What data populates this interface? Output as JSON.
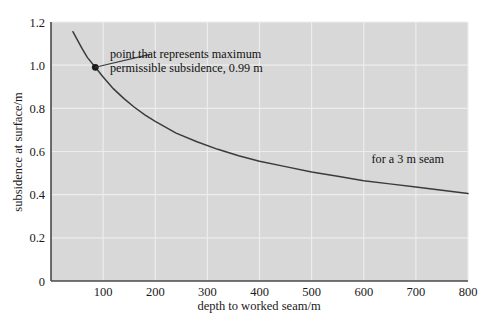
{
  "chart_data": {
    "type": "line",
    "title": "",
    "xlabel": "depth to worked seam/m",
    "ylabel": "subsidence at surface/m",
    "xlim": [
      0,
      800
    ],
    "ylim": [
      0,
      1.2
    ],
    "xticks": [
      "100",
      "200",
      "300",
      "400",
      "500",
      "600",
      "700",
      "800"
    ],
    "xtick_values": [
      100,
      200,
      300,
      400,
      500,
      600,
      700,
      800
    ],
    "yticks": [
      "0",
      "0.2",
      "0.4",
      "0.6",
      "0.8",
      "1.0",
      "1.2"
    ],
    "ytick_values": [
      0,
      0.2,
      0.4,
      0.6,
      0.8,
      1.0,
      1.2
    ],
    "grid": true,
    "legend_position": "none",
    "series": [
      {
        "name": "for a 3 m seam",
        "x": [
          42,
          50,
          60,
          70,
          85,
          100,
          120,
          140,
          160,
          180,
          200,
          240,
          280,
          320,
          360,
          400,
          450,
          500,
          550,
          600,
          650,
          700,
          750,
          800
        ],
        "y": [
          1.155,
          1.12,
          1.075,
          1.035,
          0.99,
          0.945,
          0.89,
          0.845,
          0.805,
          0.77,
          0.74,
          0.685,
          0.645,
          0.61,
          0.58,
          0.555,
          0.53,
          0.505,
          0.485,
          0.465,
          0.45,
          0.435,
          0.42,
          0.405
        ]
      }
    ],
    "points": [
      {
        "name": "maximum-permissible-subsidence",
        "x": 85,
        "y": 0.99,
        "marker": "filled-circle"
      }
    ],
    "annotations": [
      {
        "name": "max-subsidence-annotation",
        "line1": "point that represents maximum",
        "line2": "permissible subsidence, 0.99 m",
        "leader_from_x": 85,
        "leader_from_y": 0.99,
        "leader_to_x": 190,
        "leader_to_y": 1.05
      },
      {
        "name": "seam-annotation",
        "text": "for a 3 m seam",
        "x": 615,
        "y": 0.545
      }
    ],
    "colors": {
      "plot_background": "#d8d8d8",
      "grid": "#ededed",
      "axis": "#4a4a4a",
      "curve": "#3b3b3b",
      "page_background": "#ffffff",
      "text": "#1a1a1a"
    }
  }
}
